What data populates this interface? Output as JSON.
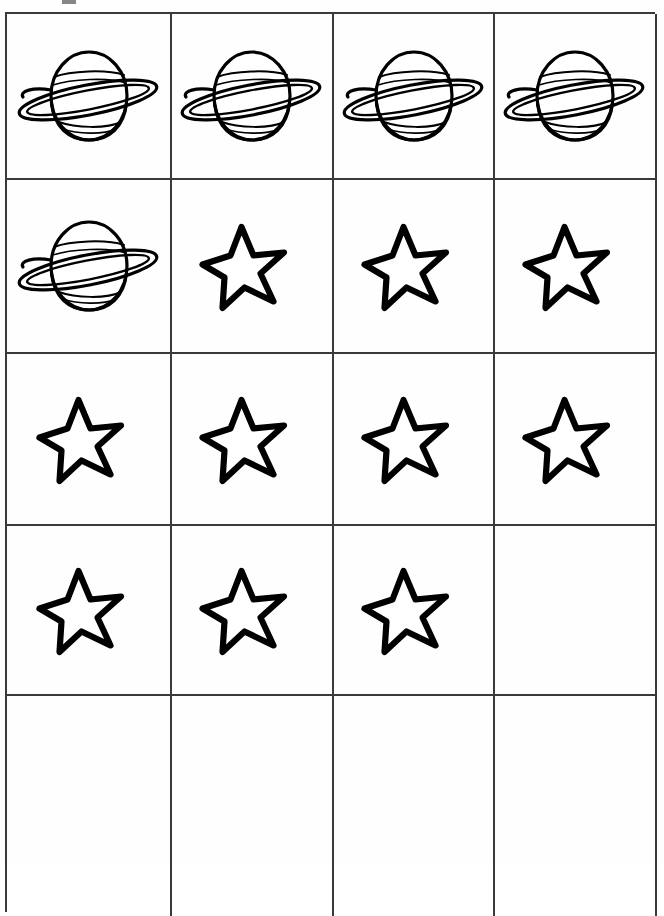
{
  "worksheet": {
    "title": "Counting worksheet grid",
    "background_color": "#ffffff",
    "line_color": "#3a3a3a",
    "ink_color": "#000000",
    "columns": 4,
    "rows": 5,
    "icon_names": {
      "planet": "saturn-planet-icon",
      "star": "star-icon",
      "empty": "empty-cell"
    },
    "counts": {
      "saturn_total": "5",
      "star_total": "10",
      "empty_total": "5"
    },
    "grid": [
      [
        "planet",
        "planet",
        "planet",
        "planet"
      ],
      [
        "planet",
        "star",
        "star",
        "star"
      ],
      [
        "star",
        "star",
        "star",
        "star"
      ],
      [
        "star",
        "star",
        "star",
        "empty"
      ],
      [
        "empty",
        "empty",
        "empty",
        "empty"
      ]
    ]
  }
}
